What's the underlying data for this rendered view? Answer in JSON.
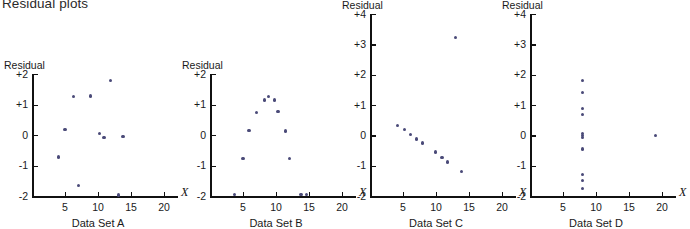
{
  "title": "Residual plots",
  "axis_labels": {
    "y_name": "Residual",
    "x_name": "X"
  },
  "point_color": "#4a4a78",
  "axis_color": "#111111",
  "chart_data": [
    {
      "type": "scatter",
      "title": "Data Set A",
      "xlabel": "X",
      "ylabel": "Residual",
      "xlim": [
        0,
        20
      ],
      "ylim": [
        -2,
        2
      ],
      "xticks": [
        5,
        10,
        15,
        20
      ],
      "yticks": [
        -2,
        -1,
        0,
        1,
        2
      ],
      "ytick_labels": [
        "-2",
        "-1",
        "0",
        "+1",
        "+2"
      ],
      "grid": false,
      "legend": "none",
      "x": [
        4.0,
        5.0,
        6.3,
        7.0,
        8.9,
        10.2,
        10.9,
        11.9,
        13.1,
        13.8
      ],
      "y": [
        -0.72,
        0.17,
        1.25,
        -1.65,
        1.28,
        0.06,
        -0.07,
        1.78,
        -1.97,
        -0.05
      ]
    },
    {
      "type": "scatter",
      "title": "Data Set B",
      "xlabel": "X",
      "ylabel": "Residual",
      "xlim": [
        0,
        20
      ],
      "ylim": [
        -2,
        2
      ],
      "xticks": [
        5,
        10,
        15,
        20
      ],
      "yticks": [
        -2,
        -1,
        0,
        1,
        2
      ],
      "ytick_labels": [
        "-2",
        "-1",
        "0",
        "+1",
        "+2"
      ],
      "grid": false,
      "legend": "none",
      "x": [
        3.7,
        5.0,
        5.9,
        7.0,
        8.3,
        8.9,
        9.8,
        10.3,
        11.4,
        12.1,
        13.8,
        14.6
      ],
      "y": [
        -1.95,
        -0.78,
        0.15,
        0.74,
        1.15,
        1.27,
        1.15,
        0.78,
        0.13,
        -0.78,
        -1.95,
        -1.95
      ]
    },
    {
      "type": "scatter",
      "title": "Data Set C",
      "xlabel": "X",
      "ylabel": "Residual",
      "xlim": [
        0,
        20
      ],
      "ylim": [
        -2,
        4
      ],
      "xticks": [
        5,
        10,
        15,
        20
      ],
      "yticks": [
        -2,
        -1,
        0,
        1,
        2,
        3,
        4
      ],
      "ytick_labels": [
        "-2",
        "-1",
        "0",
        "+1",
        "+2",
        "+3",
        "+4"
      ],
      "grid": false,
      "legend": "none",
      "x": [
        4.2,
        5.2,
        6.1,
        7.0,
        7.9,
        9.9,
        10.9,
        11.8,
        12.9,
        13.9
      ],
      "y": [
        0.33,
        0.18,
        0.02,
        -0.12,
        -0.25,
        -0.55,
        -0.72,
        -0.88,
        3.22,
        -1.18
      ]
    },
    {
      "type": "scatter",
      "title": "Data Set D",
      "xlabel": "X",
      "ylabel": "Residual",
      "xlim": [
        0,
        20
      ],
      "ylim": [
        -2,
        4
      ],
      "xticks": [
        5,
        10,
        15,
        20
      ],
      "yticks": [
        -2,
        -1,
        0,
        1,
        2,
        3,
        4
      ],
      "ytick_labels": [
        "-2",
        "-1",
        "0",
        "+1",
        "+2",
        "+3",
        "+4"
      ],
      "grid": false,
      "legend": "none",
      "x": [
        8.0,
        8.0,
        8.0,
        8.0,
        8.0,
        8.0,
        8.0,
        8.0,
        8.0,
        8.0,
        8.0,
        19.0
      ],
      "y": [
        1.82,
        1.42,
        0.88,
        0.7,
        0.05,
        -0.08,
        -0.45,
        -1.28,
        -1.48,
        -1.75,
        0.0,
        0.0
      ]
    }
  ]
}
